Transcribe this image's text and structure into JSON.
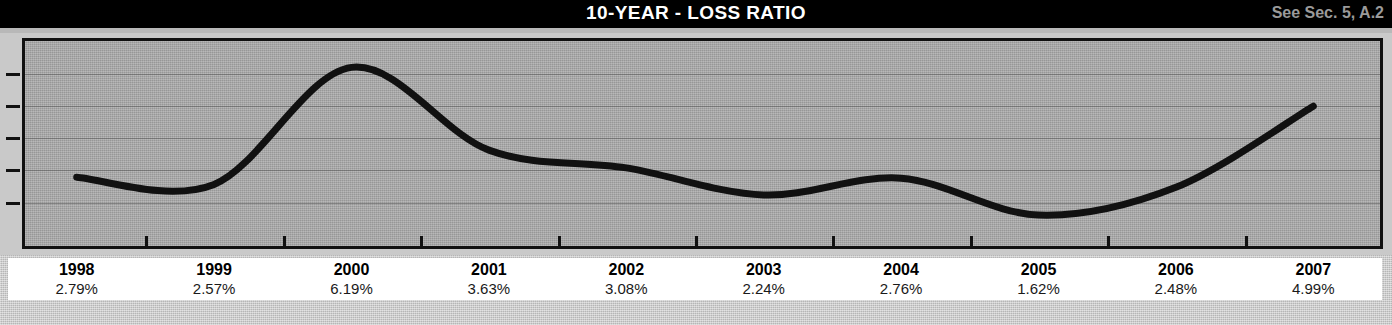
{
  "header": {
    "title": "10-YEAR - LOSS RATIO",
    "reference_note": "See Sec. 5, A.2",
    "background_color": "#000000",
    "title_color": "#ffffff",
    "note_color": "#9a9a9a"
  },
  "chart_data": {
    "type": "line",
    "title": "10-YEAR - LOSS RATIO",
    "xlabel": "",
    "ylabel": "",
    "categories": [
      "1998",
      "1999",
      "2000",
      "2001",
      "2002",
      "2003",
      "2004",
      "2005",
      "2006",
      "2007"
    ],
    "values": [
      2.79,
      2.57,
      6.19,
      3.63,
      3.08,
      2.24,
      2.76,
      1.62,
      2.48,
      4.99
    ],
    "value_labels": [
      "2.79%",
      "2.57%",
      "6.19%",
      "3.63%",
      "3.08%",
      "2.24%",
      "2.76%",
      "1.62%",
      "2.48%",
      "4.99%"
    ],
    "ylim": [
      0.6,
      7.1
    ],
    "gridlines": [
      2.0,
      3.0,
      4.0,
      5.0,
      6.0
    ],
    "grid": true,
    "legend": "none",
    "line_color": "#111111",
    "plot_background": "#a9a9a9",
    "smoothing": "spline"
  },
  "axis": {
    "tick_color": "#111111",
    "y_tick_count": 5,
    "x_tick_count": 9
  },
  "label_strip": {
    "background": "#ffffff",
    "rows": [
      {
        "year": "1998",
        "value": "2.79%"
      },
      {
        "year": "1999",
        "value": "2.57%"
      },
      {
        "year": "2000",
        "value": "6.19%"
      },
      {
        "year": "2001",
        "value": "3.63%"
      },
      {
        "year": "2002",
        "value": "3.08%"
      },
      {
        "year": "2003",
        "value": "2.24%"
      },
      {
        "year": "2004",
        "value": "2.76%"
      },
      {
        "year": "2005",
        "value": "1.62%"
      },
      {
        "year": "2006",
        "value": "2.48%"
      },
      {
        "year": "2007",
        "value": "4.99%"
      }
    ]
  }
}
